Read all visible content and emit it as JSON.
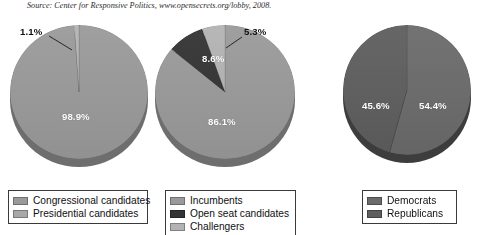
{
  "source": {
    "text": "Source: Center for Responsive Politics, www.opensecrets.org/lobby, 2008."
  },
  "colors": {
    "mid_gray": "#9a9a9a",
    "light_gray": "#b3b3b3",
    "near_black": "#333333",
    "dark_gray": "#6b6b6b",
    "dark_gray_alt": "#5e5e5e",
    "shadow_gray": "#6e6e6e",
    "shadow_dark": "#3d3d3d",
    "legend_border": "#3a3a3a",
    "label_white": "#ffffff",
    "label_black": "#111111",
    "page_background": "#ffffff"
  },
  "chart_data": [
    {
      "type": "pie",
      "title": "",
      "name": "candidate-type-pie",
      "categories": [
        "Congressional candidates",
        "Presidential candidates"
      ],
      "values": [
        98.9,
        1.1
      ],
      "labels": [
        "98.9%",
        "1.1%"
      ],
      "colors": [
        "#9a9a9a",
        "#b3b3b3"
      ],
      "callout_labels": [
        "1.1%"
      ],
      "legend_position": "bottom",
      "legend": [
        {
          "label": "Congressional candidates",
          "color": "#9a9a9a"
        },
        {
          "label": "Presidential candidates",
          "color": "#a8a8a8"
        }
      ]
    },
    {
      "type": "pie",
      "title": "",
      "name": "candidate-status-pie",
      "categories": [
        "Incumbents",
        "Open seat candidates",
        "Challengers"
      ],
      "values": [
        86.1,
        8.6,
        5.3
      ],
      "labels": [
        "86.1%",
        "8.6%",
        "5.3%"
      ],
      "colors": [
        "#9a9a9a",
        "#333333",
        "#b3b3b3"
      ],
      "callout_labels": [
        "5.3%"
      ],
      "legend_position": "bottom",
      "legend": [
        {
          "label": "Incumbents",
          "color": "#9a9a9a"
        },
        {
          "label": "Open seat candidates",
          "color": "#333333"
        },
        {
          "label": "Challengers",
          "color": "#b3b3b3"
        }
      ]
    },
    {
      "type": "pie",
      "title": "",
      "name": "party-pie",
      "categories": [
        "Democrats",
        "Republicans"
      ],
      "values": [
        54.4,
        45.6
      ],
      "labels": [
        "54.4%",
        "45.6%"
      ],
      "colors": [
        "#6b6b6b",
        "#5e5e5e"
      ],
      "callout_labels": [],
      "legend_position": "bottom",
      "legend": [
        {
          "label": "Democrats",
          "color": "#6b6b6b"
        },
        {
          "label": "Republicans",
          "color": "#5e5e5e"
        }
      ]
    }
  ]
}
